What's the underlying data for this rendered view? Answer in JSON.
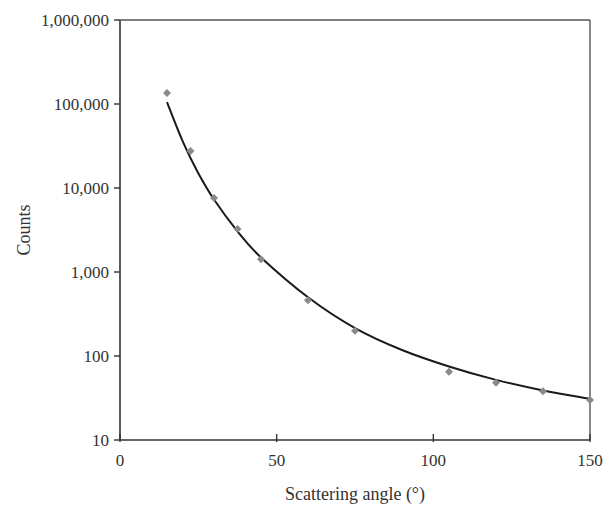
{
  "chart_data": {
    "type": "scatter",
    "title": "",
    "xlabel": "Scattering angle (°)",
    "ylabel": "Counts",
    "xlim": [
      0,
      150
    ],
    "ylim": [
      10,
      1000000
    ],
    "yscale": "log",
    "grid": false,
    "legend": null,
    "x_ticks": [
      0,
      50,
      100,
      150
    ],
    "x_tick_labels": [
      "0",
      "50",
      "100",
      "150"
    ],
    "y_ticks": [
      10,
      100,
      1000,
      10000,
      100000,
      1000000
    ],
    "y_tick_labels": [
      "10",
      "100",
      "1,000",
      "10,000",
      "100,000",
      "1,000,000"
    ],
    "series": [
      {
        "name": "Measured counts",
        "kind": "markers",
        "marker": "diamond",
        "color": "#8a8a8a",
        "x": [
          15,
          22.5,
          30,
          37.5,
          45,
          60,
          75,
          105,
          120,
          135,
          150
        ],
        "y": [
          135000,
          27500,
          7600,
          3250,
          1420,
          460,
          200,
          65,
          48,
          38,
          30
        ]
      },
      {
        "name": "Theoretical fit",
        "kind": "line",
        "color": "#1a1a1a",
        "x": [
          15,
          20,
          25,
          30,
          37.5,
          45,
          60,
          75,
          90,
          105,
          120,
          135,
          150
        ],
        "y": [
          105000,
          36000,
          15000,
          7300,
          3050,
          1490,
          500,
          215,
          118,
          75,
          52,
          39,
          31
        ]
      }
    ]
  }
}
